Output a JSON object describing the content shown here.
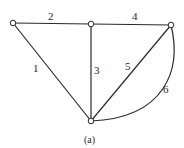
{
  "diagram": {
    "type": "graph",
    "caption": "(a)",
    "nodes": [
      {
        "id": "A",
        "x": 13,
        "y": 23
      },
      {
        "id": "B",
        "x": 91,
        "y": 24
      },
      {
        "id": "C",
        "x": 171,
        "y": 25
      },
      {
        "id": "D",
        "x": 91,
        "y": 121
      }
    ],
    "edges": [
      {
        "label": "1",
        "from": "A",
        "to": "D"
      },
      {
        "label": "2",
        "from": "A",
        "to": "B"
      },
      {
        "label": "3",
        "from": "B",
        "to": "D"
      },
      {
        "label": "4",
        "from": "B",
        "to": "C"
      },
      {
        "label": "5",
        "from": "C",
        "to": "D"
      },
      {
        "label": "6",
        "from": "C",
        "to": "D",
        "curved": true
      }
    ],
    "colors": {
      "stroke": "#2a2a2a",
      "background": "#ffffff"
    }
  }
}
